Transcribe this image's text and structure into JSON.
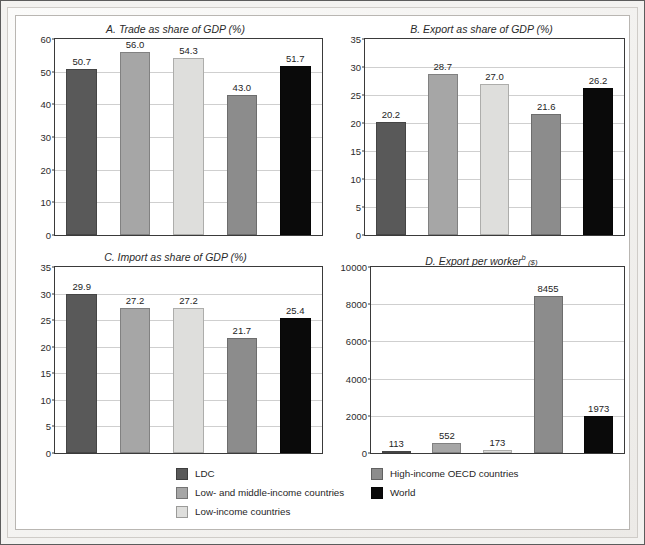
{
  "figure": {
    "background": "#ffffff",
    "frame_color": "#5c5c5c"
  },
  "series_colors": {
    "ldc": "#595959",
    "low_and_middle_income": "#a6a6a6",
    "low_income": "#dededc",
    "high_income_oecd": "#8c8c8c",
    "world": "#0a0a0a"
  },
  "legend": {
    "left_column": [
      {
        "label": "LDC",
        "color": "#595959",
        "key": "ldc"
      },
      {
        "label": "Low- and middle-income countries",
        "color": "#a6a6a6",
        "key": "low_and_middle_income"
      },
      {
        "label": "Low-income countries",
        "color": "#dededc",
        "key": "low_income"
      }
    ],
    "right_column": [
      {
        "label": "High-income OECD countries",
        "color": "#8c8c8c",
        "key": "high_income_oecd"
      },
      {
        "label": "World",
        "color": "#0a0a0a",
        "key": "world"
      }
    ]
  },
  "chart_data": [
    {
      "id": "panel-a",
      "type": "bar",
      "title": "A. Trade as share of GDP (%)",
      "xlabel": "",
      "ylabel": "",
      "ylim": [
        0,
        60
      ],
      "yticks": [
        0,
        10,
        20,
        30,
        40,
        50,
        60
      ],
      "grid": true,
      "legend_position": "below-figure",
      "categories": [
        "LDC",
        "Low- and middle-income countries",
        "Low-income countries",
        "High-income OECD countries",
        "World"
      ],
      "values": [
        50.7,
        56.0,
        54.3,
        43.0,
        51.7
      ],
      "labels": [
        "50.7",
        "56.0",
        "54.3",
        "43.0",
        "51.7"
      ],
      "colors": [
        "#595959",
        "#a6a6a6",
        "#dededc",
        "#8c8c8c",
        "#0a0a0a"
      ]
    },
    {
      "id": "panel-b",
      "type": "bar",
      "title": "B. Export as share of GDP (%)",
      "xlabel": "",
      "ylabel": "",
      "ylim": [
        0,
        35
      ],
      "yticks": [
        0,
        5,
        10,
        15,
        20,
        25,
        30,
        35
      ],
      "grid": true,
      "legend_position": "below-figure",
      "categories": [
        "LDC",
        "Low- and middle-income countries",
        "Low-income countries",
        "High-income OECD countries",
        "World"
      ],
      "values": [
        20.2,
        28.7,
        27.0,
        21.6,
        26.2
      ],
      "labels": [
        "20.2",
        "28.7",
        "27.0",
        "21.6",
        "26.2"
      ],
      "colors": [
        "#595959",
        "#a6a6a6",
        "#dededc",
        "#8c8c8c",
        "#0a0a0a"
      ]
    },
    {
      "id": "panel-c",
      "type": "bar",
      "title": "C. Import as share of GDP (%)",
      "xlabel": "",
      "ylabel": "",
      "ylim": [
        0,
        35
      ],
      "yticks": [
        0,
        5,
        10,
        15,
        20,
        25,
        30,
        35
      ],
      "grid": true,
      "legend_position": "below-figure",
      "categories": [
        "LDC",
        "Low- and middle-income countries",
        "Low-income countries",
        "High-income OECD countries",
        "World"
      ],
      "values": [
        29.9,
        27.2,
        27.2,
        21.7,
        25.4
      ],
      "labels": [
        "29.9",
        "27.2",
        "27.2",
        "21.7",
        "25.4"
      ],
      "colors": [
        "#595959",
        "#a6a6a6",
        "#dededc",
        "#8c8c8c",
        "#0a0a0a"
      ]
    },
    {
      "id": "panel-d",
      "type": "bar",
      "title": "D. Export per workerb ($)",
      "title_main": "D. Export per worker",
      "title_superscript": "b",
      "title_unit": "($)",
      "xlabel": "",
      "ylabel": "",
      "ylim": [
        0,
        10000
      ],
      "yticks": [
        0,
        2000,
        4000,
        6000,
        8000,
        10000
      ],
      "grid": true,
      "legend_position": "below-figure",
      "categories": [
        "LDC",
        "Low- and middle-income countries",
        "Low-income countries",
        "High-income OECD countries",
        "World"
      ],
      "values": [
        113,
        552,
        173,
        8455,
        1973
      ],
      "labels": [
        "113",
        "552",
        "173",
        "8455",
        "1973"
      ],
      "colors": [
        "#595959",
        "#a6a6a6",
        "#dededc",
        "#8c8c8c",
        "#0a0a0a"
      ]
    }
  ]
}
